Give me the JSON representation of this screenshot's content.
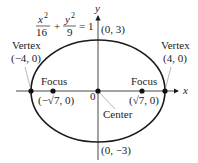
{
  "diagram": {
    "equation": {
      "x_numerator": "x",
      "x_exponent": "2",
      "x_denominator": "16",
      "plus": "+",
      "y_numerator": "y",
      "y_exponent": "2",
      "y_denominator": "9",
      "equals": "= 1"
    },
    "axes": {
      "x_label": "x",
      "y_label": "y",
      "origin_label": "0"
    },
    "labels": {
      "left_vertex_title": "Vertex",
      "left_vertex_coord": "(−4, 0)",
      "right_vertex_title": "Vertex",
      "right_vertex_coord": "(4, 0)",
      "left_focus_title": "Focus",
      "left_focus_coord": "(−√7, 0)",
      "right_focus_title": "Focus",
      "right_focus_coord": "(√7, 0)",
      "center_title": "Center",
      "top_coord": "(0, 3)",
      "bottom_coord": "(0, −3)"
    },
    "colors": {
      "stroke": "#1a1a1a",
      "text": "#222222",
      "leader": "#888888"
    }
  }
}
